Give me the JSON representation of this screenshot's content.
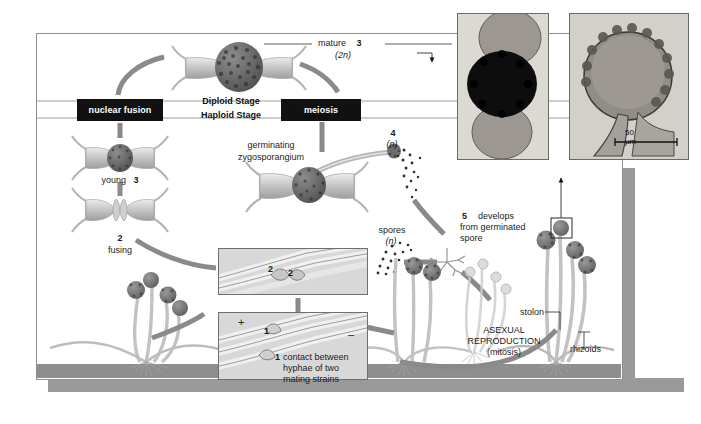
{
  "diagram": {
    "frame": {
      "border_color": "#8f8f8f",
      "background": "#ffffff"
    },
    "shadow_color": "#9a9a9a",
    "stage_bands": {
      "diploid_label": "Diploid Stage",
      "haploid_label": "Haploid Stage"
    },
    "process_boxes": [
      {
        "name": "nuclear-fusion",
        "label": "nuclear fusion"
      },
      {
        "name": "meiosis",
        "label": "meiosis"
      }
    ],
    "labels": {
      "mature": "mature",
      "mature_num": "3",
      "mature_ploidy": "(2n)",
      "young": "young",
      "young_num": "3",
      "fusing_num": "2",
      "fusing": "fusing",
      "germinating": "germinating",
      "zygosporangium": "zygosporangium",
      "four_num": "4",
      "four_ploidy": "(n)",
      "spores": "spores",
      "spores_ploidy": "(n)",
      "five_num": "5",
      "five_text_1": "develops",
      "five_text_2": "from germinated",
      "five_text_3": "spore",
      "asexual_1": "ASEXUAL",
      "asexual_2": "REPRODUCTION",
      "asexual_3": "(mitosis)",
      "stolon": "stolon",
      "rhizoids": "rhizoids",
      "scale_bar": "50 µm",
      "gametangia_num_left": "2",
      "gametangia_num_right": "2",
      "contact_num_upper": "1",
      "contact_num_lower": "1",
      "plus_strain": "+",
      "minus_strain": "–",
      "contact_1": "contact between",
      "contact_2": "hyphae of two",
      "contact_3": "mating strains"
    },
    "photos": [
      {
        "name": "zygosporangium-micrograph",
        "caption_ref": "mature (2n)"
      },
      {
        "name": "sporangium-micrograph",
        "caption_ref": "50 µm"
      }
    ],
    "colors": {
      "box_fill": "#111111",
      "box_text": "#ffffff",
      "arrow": "#8a8a8a",
      "hypha": "#b8b8b8",
      "spore_head": "#6f6f6f",
      "ground": "#8e8e8e",
      "inset_fill": "#d8d8d8"
    }
  }
}
